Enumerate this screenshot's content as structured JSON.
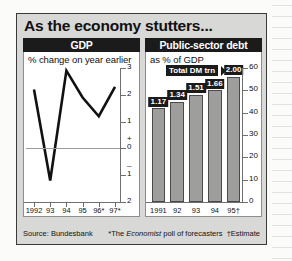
{
  "headline": "As the economy stutters...",
  "panels": {
    "gdp": {
      "title": "GDP",
      "subtitle": "% change on year earlier",
      "source": "Source: Bundesbank"
    },
    "debt": {
      "title": "Public-sector debt",
      "subtitle": "as % of GDP",
      "annotation": "Total DM trn",
      "footnote_star": "*The ",
      "footnote_ital": "Economist",
      "footnote_rest": " poll of forecasters",
      "footnote_dagger": "†Estimate"
    }
  },
  "colors": {
    "figure_background": "#d8d8d6",
    "panel_title_background": "#1b1b1b",
    "panel_title_text": "#ffffff",
    "plot_background": "#ffffff",
    "bar_fill": "#9e9e9c",
    "bar_outline": "#4a4a4a",
    "line_stroke": "#111111",
    "axis_stroke": "#6f6f6f",
    "frame_border": "#3a3a3a"
  },
  "chart_data": [
    {
      "type": "line",
      "title": "GDP",
      "subtitle": "% change on year earlier",
      "xlabel": "",
      "ylabel": "% change on year earlier",
      "categories": [
        "1992",
        "93",
        "94",
        "95",
        "96*",
        "97*"
      ],
      "x": [
        "1992",
        "93",
        "94",
        "95",
        "96*",
        "97*"
      ],
      "values": [
        2.2,
        -1.2,
        2.9,
        1.9,
        1.2,
        2.3
      ],
      "series": [
        {
          "name": "GDP % change on year earlier",
          "values": [
            2.2,
            -1.2,
            2.9,
            1.9,
            1.2,
            2.3
          ]
        }
      ],
      "ylim": [
        -2,
        3
      ],
      "yticks": [
        3,
        2,
        1,
        0,
        -1,
        -2
      ],
      "ytick_labels": [
        "3",
        "2",
        "1",
        "0",
        "1",
        "2"
      ],
      "zero_sign_plus": "+",
      "zero_sign_minus": "–",
      "grid": false,
      "legend": "none",
      "axis_position": "right",
      "note": "Source: Bundesbank"
    },
    {
      "type": "bar",
      "title": "Public-sector debt",
      "subtitle": "as % of GDP",
      "xlabel": "",
      "ylabel": "as % of GDP",
      "categories": [
        "1991",
        "92",
        "93",
        "94",
        "95†"
      ],
      "values": [
        42,
        45,
        48,
        50,
        56
      ],
      "bar_labels": [
        "1.17",
        "1.34",
        "1.51",
        "1.66",
        "2.00"
      ],
      "bar_label_caption": "Total DM trn",
      "series": [
        {
          "name": "Public-sector debt as % of GDP",
          "values": [
            42,
            45,
            48,
            50,
            56
          ]
        },
        {
          "name": "Total DM trn",
          "values": [
            1.17,
            1.34,
            1.51,
            1.66,
            2.0
          ]
        }
      ],
      "ylim": [
        0,
        60
      ],
      "yticks": [
        0,
        10,
        20,
        30,
        40,
        50,
        60
      ],
      "ytick_labels": [
        "0",
        "10",
        "20",
        "30",
        "40",
        "50",
        "60"
      ],
      "grid": false,
      "legend": "none",
      "axis_position": "right",
      "note": "*The Economist poll of forecasters  †Estimate"
    }
  ]
}
